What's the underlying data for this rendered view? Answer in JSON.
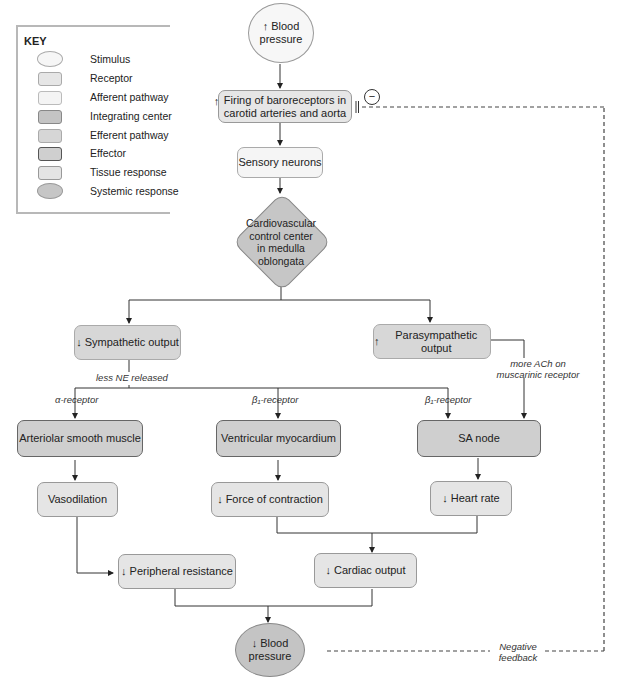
{
  "key": {
    "title": "KEY",
    "items": [
      {
        "type": "stimulus",
        "label": "Stimulus"
      },
      {
        "type": "receptor",
        "label": "Receptor"
      },
      {
        "type": "afferent",
        "label": "Afferent pathway"
      },
      {
        "type": "integrating",
        "label": "Integrating center"
      },
      {
        "type": "efferent",
        "label": "Efferent pathway"
      },
      {
        "type": "effector",
        "label": "Effector"
      },
      {
        "type": "tissue",
        "label": "Tissue response"
      },
      {
        "type": "systemic",
        "label": "Systemic response"
      }
    ]
  },
  "nodes": {
    "stimulus": {
      "arrow": "↑",
      "label": "Blood pressure",
      "line1": "Blood",
      "line2": "pressure"
    },
    "receptor": {
      "arrow": "↑",
      "line1": "Firing of baroreceptors in",
      "line2": "carotid arteries and aorta"
    },
    "afferent": {
      "label": "Sensory neurons"
    },
    "integrating": {
      "line1": "Cardiovascular",
      "line2": "control center",
      "line3": "in medulla",
      "line4": "oblongata"
    },
    "sympathetic": {
      "arrow": "↓",
      "label": "Sympathetic output"
    },
    "parasympathetic": {
      "arrow": "↑",
      "label": "Parasympathetic output"
    },
    "arteriolar": {
      "label": "Arteriolar smooth muscle"
    },
    "ventricular": {
      "label": "Ventricular myocardium"
    },
    "sa_node": {
      "label": "SA node"
    },
    "vasodilation": {
      "label": "Vasodilation"
    },
    "force": {
      "arrow": "↓",
      "label": "Force of contraction"
    },
    "heart_rate": {
      "arrow": "↓",
      "label": "Heart rate"
    },
    "peripheral": {
      "arrow": "↓",
      "label": "Peripheral resistance"
    },
    "cardiac": {
      "arrow": "↓",
      "label": "Cardiac output"
    },
    "systemic": {
      "arrow": "↓",
      "line1": "Blood",
      "line2": "pressure"
    }
  },
  "labels": {
    "less_ne": "less NE released",
    "alpha": "α-receptor",
    "beta1_a": "β₁-receptor",
    "beta1_b": "β₁-receptor",
    "ach_1": "more ACh on",
    "ach_2": "muscarinic receptor",
    "neg_1": "Negative",
    "neg_2": "feedback",
    "minus": "−"
  }
}
